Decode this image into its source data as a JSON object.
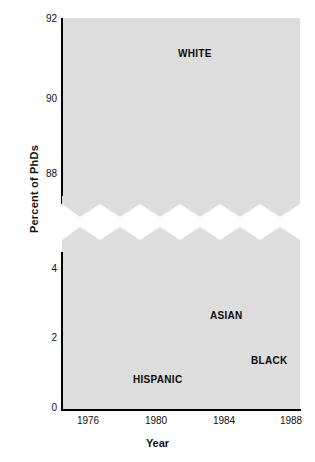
{
  "axes": {
    "ylabel": "Percent of PhDs",
    "xlabel": "Year"
  },
  "top_panel": {
    "yticks": [
      "92",
      "90",
      "88"
    ],
    "series_tag": "WHITE"
  },
  "bottom_panel": {
    "yticks": [
      "4",
      "2",
      "0"
    ],
    "tags": {
      "asian": "ASIAN",
      "black": "BLACK",
      "hispanic": "HISPANIC"
    }
  },
  "xticks": [
    "1976",
    "1980",
    "1984",
    "1988"
  ],
  "colors": {
    "plot_background": "#dddddd",
    "gridline": "#ffffff",
    "line": "#0d0d0d",
    "text": "#111111",
    "page_background": "#ffffff"
  },
  "chart_data": {
    "type": "line",
    "title": "",
    "xlabel": "Year",
    "ylabel": "Percent of PhDs",
    "grid": true,
    "legend": "inline-labels",
    "broken_axis": true,
    "panels": [
      {
        "name": "top",
        "ylim": [
          87.2,
          92.0
        ],
        "yticks": [
          88,
          90,
          92
        ],
        "xlim": [
          1975,
          1988.6
        ],
        "series": [
          {
            "name": "WHITE",
            "linestyle": "dashed",
            "x": [
              1975,
              1975.5,
              1976,
              1976.5,
              1977,
              1977.5,
              1978,
              1978.5,
              1979,
              1979.5,
              1980,
              1980.5,
              1981,
              1981.5,
              1982,
              1982.5,
              1983,
              1983.5,
              1984,
              1984.5,
              1985,
              1985.5,
              1986,
              1986.5,
              1987,
              1987.5,
              1988
            ],
            "values": [
              91.65,
              91.68,
              91.6,
              91.35,
              90.85,
              90.2,
              89.4,
              88.6,
              88.0,
              87.82,
              87.78,
              87.62,
              87.95,
              88.5,
              89.1,
              89.75,
              90.35,
              90.6,
              90.62,
              90.55,
              90.3,
              90.05,
              90.08,
              90.25,
              90.55,
              89.7,
              90.1
            ]
          }
        ]
      },
      {
        "name": "bottom",
        "ylim": [
          0,
          4.6
        ],
        "yticks": [
          0,
          2,
          4
        ],
        "xlim": [
          1975,
          1988.6
        ],
        "series": [
          {
            "name": "ASIAN",
            "linestyle": "square-dashed",
            "x": [
              1975,
              1975.5,
              1976,
              1976.5,
              1977,
              1977.5,
              1978,
              1978.5,
              1979,
              1979.5,
              1980,
              1980.5,
              1981,
              1981.5,
              1982,
              1982.5,
              1983,
              1983.5,
              1984,
              1984.5,
              1985,
              1985.5,
              1986,
              1986.5,
              1987,
              1987.5,
              1988
            ],
            "values": [
              1.45,
              1.5,
              1.58,
              1.68,
              1.78,
              1.9,
              2.0,
              2.12,
              2.28,
              2.45,
              2.5,
              2.48,
              2.46,
              2.5,
              2.6,
              2.72,
              2.85,
              2.95,
              3.0,
              3.02,
              3.08,
              3.2,
              3.32,
              3.45,
              3.58,
              3.5,
              3.52
            ]
          },
          {
            "name": "BLACK",
            "linestyle": "solid",
            "x": [
              1975,
              1975.5,
              1976,
              1976.5,
              1977,
              1977.5,
              1978,
              1978.5,
              1979,
              1979.5,
              1980,
              1980.5,
              1981,
              1981.5,
              1982,
              1982.5,
              1983,
              1983.5,
              1984,
              1984.5,
              1985,
              1985.5,
              1986,
              1986.5,
              1987,
              1987.5,
              1988
            ],
            "values": [
              1.65,
              1.7,
              1.78,
              1.88,
              1.95,
              2.0,
              2.08,
              2.14,
              2.18,
              2.1,
              2.0,
              2.05,
              2.08,
              2.1,
              2.1,
              2.1,
              2.12,
              2.14,
              2.16,
              2.12,
              2.02,
              1.95,
              1.9,
              1.88,
              1.87,
              1.87,
              1.87
            ]
          },
          {
            "name": "HISPANIC",
            "linestyle": "dash-dot",
            "x": [
              1975,
              1975.5,
              1976,
              1976.5,
              1977,
              1977.5,
              1978,
              1978.5,
              1979,
              1979.5,
              1980,
              1980.5,
              1981,
              1981.5,
              1982,
              1982.5,
              1983,
              1983.5,
              1984,
              1984.5,
              1985,
              1985.5,
              1986,
              1986.5,
              1987,
              1987.5,
              1988
            ],
            "values": [
              0.8,
              0.78,
              0.76,
              0.85,
              0.98,
              1.08,
              1.1,
              1.1,
              1.12,
              1.18,
              1.25,
              1.32,
              1.4,
              1.5,
              1.58,
              1.6,
              1.66,
              1.78,
              1.88,
              1.9,
              1.9,
              2.0,
              2.12,
              2.22,
              2.32,
              2.42,
              2.48
            ]
          }
        ]
      }
    ]
  }
}
